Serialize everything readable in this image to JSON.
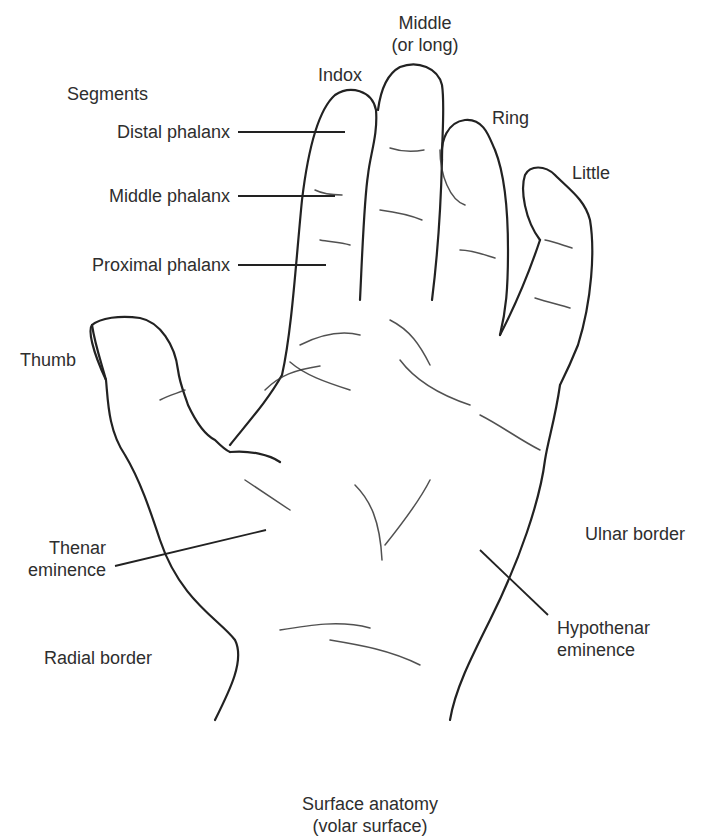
{
  "figure": {
    "caption_line1": "Surface anatomy",
    "caption_line2": "(volar surface)",
    "segments_heading": "Segments",
    "segments": [
      {
        "label": "Distal phalanx"
      },
      {
        "label": "Middle phalanx"
      },
      {
        "label": "Proximal phalanx"
      }
    ],
    "fingers": {
      "index": "Indox",
      "middle_line1": "Middle",
      "middle_line2": "(or long)",
      "ring": "Ring",
      "little": "Little",
      "thumb": "Thumb"
    },
    "regions": {
      "thenar_line1": "Thenar",
      "thenar_line2": "eminence",
      "hypothenar_line1": "Hypothenar",
      "hypothenar_line2": "eminence",
      "ulnar_border": "Ulnar border",
      "radial_border": "Radial border"
    },
    "colors": {
      "line": "#222222",
      "text": "#2e2e2e",
      "background": "#ffffff"
    }
  }
}
